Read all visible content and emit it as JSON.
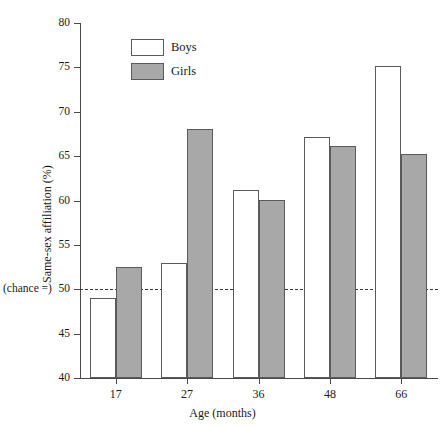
{
  "chart_data": {
    "type": "bar",
    "title": "",
    "xlabel": "Age (months)",
    "ylabel": "Same-sex affiliation (%)",
    "categories": [
      "17",
      "27",
      "36",
      "48",
      "66"
    ],
    "ylim": [
      40,
      80
    ],
    "yticks": [
      40,
      45,
      50,
      55,
      60,
      65,
      70,
      75,
      80
    ],
    "ytick_labels": [
      "40",
      "45",
      "50",
      "55",
      "60",
      "65",
      "70",
      "75",
      "80"
    ],
    "grid": false,
    "legend_position": "upper-left-inside",
    "series": [
      {
        "name": "Boys",
        "color": "#ffffff",
        "values": [
          49.0,
          53.0,
          61.2,
          67.2,
          75.2
        ]
      },
      {
        "name": "Girls",
        "color": "#a8a8a8",
        "values": [
          52.5,
          68.1,
          60.1,
          66.1,
          65.2
        ]
      }
    ],
    "annotations": [
      {
        "name": "chance-line",
        "label": "(chance =)",
        "value": 50,
        "style": "dashed-horizontal"
      }
    ]
  },
  "legend": {
    "items": [
      {
        "label": "Boys",
        "swatch": "white-square-icon"
      },
      {
        "label": "Girls",
        "swatch": "gray-square-icon"
      }
    ]
  },
  "axes": {
    "x_title": "Age (months)",
    "y_title": "Same-sex affiliation (%)",
    "chance_text": "(chance =)"
  }
}
